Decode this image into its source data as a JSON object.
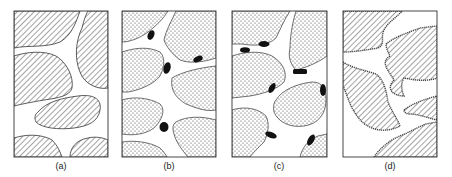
{
  "figure": {
    "panels": [
      {
        "id": "a",
        "label": "(a)",
        "fill_pattern": "hatch",
        "description": "Hatched grains separated by open pore space"
      },
      {
        "id": "b",
        "label": "(b)",
        "fill_pattern": "dots",
        "description": "Dotted grains with black particles isolated in pore channels"
      },
      {
        "id": "c",
        "label": "(c)",
        "fill_pattern": "dots",
        "description": "Dotted grains with black particles attached to grain surfaces"
      },
      {
        "id": "d",
        "label": "(d)",
        "fill_pattern": "hatch",
        "description": "Hatched grains with coated/beaded grain boundaries"
      }
    ]
  },
  "colors": {
    "ink": "#222222",
    "background": "#ffffff",
    "particle": "#111111"
  }
}
